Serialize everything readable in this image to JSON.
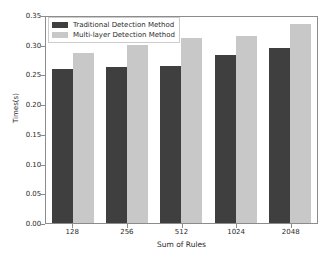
{
  "chart_data": {
    "type": "bar",
    "title": "",
    "xlabel": "Sum of Rules",
    "ylabel": "Times(s)",
    "categories": [
      "128",
      "256",
      "512",
      "1024",
      "2048"
    ],
    "series": [
      {
        "name": "Traditional Detection Method",
        "color": "#3f3f3f",
        "values": [
          0.259,
          0.262,
          0.264,
          0.282,
          0.294
        ]
      },
      {
        "name": "Multi-layer Detection Method",
        "color": "#c8c8c8",
        "values": [
          0.286,
          0.3,
          0.311,
          0.315,
          0.335
        ]
      }
    ],
    "ylim": [
      0.0,
      0.35
    ],
    "yticks": [
      "0.00",
      "0.05",
      "0.10",
      "0.15",
      "0.20",
      "0.25",
      "0.30",
      "0.35"
    ],
    "ytick_values": [
      0.0,
      0.05,
      0.1,
      0.15,
      0.2,
      0.25,
      0.3,
      0.35
    ],
    "grid": false,
    "legend_position": "upper left"
  },
  "legend": {
    "entries": [
      {
        "label": "Traditional Detection Method"
      },
      {
        "label": "Multi-layer Detection Method"
      }
    ]
  }
}
